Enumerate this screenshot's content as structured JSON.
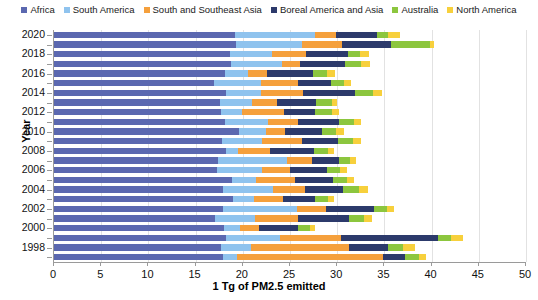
{
  "chart_data": {
    "type": "bar",
    "orientation": "horizontal",
    "stacked": true,
    "title": "",
    "xlabel": "1 Tg of PM2.5 emitted",
    "ylabel": "Year",
    "xlim": [
      0,
      50
    ],
    "xticks": [
      0,
      5,
      10,
      15,
      20,
      25,
      30,
      35,
      40,
      45,
      50
    ],
    "grid": true,
    "legend_position": "top",
    "categories": [
      2020,
      2019,
      2018,
      2017,
      2016,
      2015,
      2014,
      2013,
      2012,
      2011,
      2010,
      2009,
      2008,
      2007,
      2006,
      2005,
      2004,
      2003,
      2002,
      2001,
      2000,
      1999,
      1998,
      1997
    ],
    "ytick_labels": [
      "2020",
      "2018",
      "2016",
      "2014",
      "2012",
      "2010",
      "2008",
      "2006",
      "2004",
      "2002",
      "2000",
      "1998"
    ],
    "series": [
      {
        "name": "Africa",
        "color": "#5B68B0",
        "values": [
          19.2,
          19.3,
          18.6,
          18.8,
          18.1,
          16.9,
          18.2,
          17.6,
          17.7,
          18.1,
          19.6,
          17.8,
          18.2,
          17.4,
          17.3,
          18.9,
          17.9,
          19.0,
          17.9,
          17.1,
          18.0,
          18.2,
          17.7,
          17.9
        ]
      },
      {
        "name": "South America",
        "color": "#8FC3EE",
        "values": [
          8.5,
          7.0,
          4.5,
          5.3,
          2.5,
          5.0,
          3.7,
          3.4,
          2.2,
          4.6,
          2.9,
          4.2,
          1.3,
          7.3,
          4.7,
          2.5,
          5.3,
          2.2,
          7.8,
          4.2,
          1.7,
          5.7,
          3.2,
          1.5
        ]
      },
      {
        "name": "South and Southeast Asia",
        "color": "#F5A03C",
        "values": [
          2.2,
          4.2,
          3.6,
          2.0,
          2.0,
          4.0,
          4.5,
          2.6,
          4.5,
          3.1,
          2.0,
          4.3,
          3.4,
          2.6,
          3.0,
          4.1,
          3.4,
          3.1,
          3.1,
          4.5,
          2.0,
          6.5,
          10.3,
          15.4
        ]
      },
      {
        "name": "Boreal America and Asia",
        "color": "#2C3A6B",
        "values": [
          4.3,
          5.2,
          4.4,
          4.7,
          4.8,
          3.4,
          5.5,
          4.2,
          3.3,
          4.4,
          3.9,
          3.8,
          4.6,
          2.9,
          3.9,
          4.1,
          4.0,
          3.4,
          5.1,
          5.5,
          4.2,
          10.3,
          4.2,
          2.4
        ]
      },
      {
        "name": "Australia",
        "color": "#8CC63E",
        "values": [
          1.2,
          4.1,
          1.3,
          1.7,
          1.5,
          1.4,
          1.9,
          1.6,
          1.7,
          1.6,
          1.5,
          1.6,
          1.5,
          1.2,
          1.4,
          1.4,
          1.7,
          1.3,
          1.4,
          1.5,
          1.2,
          1.4,
          1.6,
          1.5
        ]
      },
      {
        "name": "North America",
        "color": "#F7D03C",
        "values": [
          1.3,
          0.5,
          1.0,
          1.0,
          0.9,
          0.8,
          1.0,
          0.6,
          0.8,
          0.7,
          0.8,
          0.8,
          0.7,
          0.6,
          0.7,
          0.8,
          1.0,
          0.7,
          0.7,
          0.9,
          0.6,
          1.2,
          1.2,
          0.7
        ]
      }
    ]
  }
}
